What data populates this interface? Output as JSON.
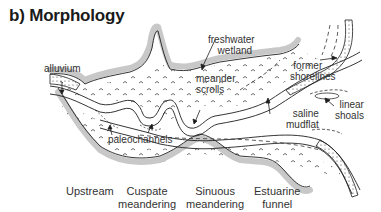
{
  "title": "b) Morphology",
  "labels": {
    "alluvium": "alluvium",
    "freshwater_wetland": [
      "freshwater",
      "wetland"
    ],
    "meander_scrolls": [
      "meander",
      "scrolls"
    ],
    "former_shorelines": [
      "former",
      "shorelines"
    ],
    "linear_shoals": [
      "linear",
      "shoals"
    ],
    "saline_mudflat": [
      "saline",
      "mudflat"
    ],
    "paleochannels": "paleochannels"
  },
  "zones": [
    {
      "line1": "Upstream",
      "line2": ""
    },
    {
      "line1": "Cuspate",
      "line2": "meandering"
    },
    {
      "line1": "Sinuous",
      "line2": "meandering"
    },
    {
      "line1": "Estuarine",
      "line2": "funnel"
    }
  ],
  "colors": {
    "outline": "#1e1e1e",
    "shading": "#c8c8c8",
    "text": "#333333"
  }
}
